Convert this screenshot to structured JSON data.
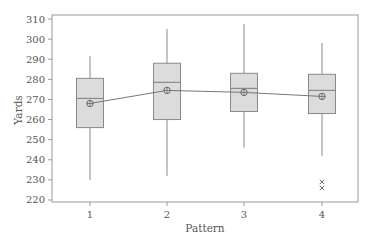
{
  "chart_data": {
    "type": "box",
    "title": "",
    "xlabel": "Pattern",
    "ylabel": "Yards",
    "categories": [
      "1",
      "2",
      "3",
      "4"
    ],
    "ylim": [
      218,
      312
    ],
    "yticks": [
      220,
      230,
      240,
      250,
      260,
      270,
      280,
      290,
      300,
      310
    ],
    "grid": false,
    "legend": null,
    "boxes": [
      {
        "category": "1",
        "whisker_low": 230,
        "q1": 256,
        "median": 270.5,
        "q3": 280.5,
        "whisker_high": 291.5,
        "mean": 268,
        "outliers": []
      },
      {
        "category": "2",
        "whisker_low": 232,
        "q1": 260,
        "median": 278.5,
        "q3": 288,
        "whisker_high": 305,
        "mean": 274.5,
        "outliers": []
      },
      {
        "category": "3",
        "whisker_low": 246,
        "q1": 264,
        "median": 275.5,
        "q3": 283,
        "whisker_high": 307.5,
        "mean": 273.5,
        "outliers": []
      },
      {
        "category": "4",
        "whisker_low": 242,
        "q1": 263,
        "median": 274.5,
        "q3": 282.5,
        "whisker_high": 298,
        "mean": 271.5,
        "outliers": [
          229,
          226
        ]
      }
    ],
    "mean_line": {
      "connects": "means",
      "marker": "circle-plus"
    },
    "colors": {
      "box_fill": "#dcdcdc",
      "stroke": "#8a8a8a",
      "axis": "#9a9a9a",
      "text": "#555555"
    }
  }
}
